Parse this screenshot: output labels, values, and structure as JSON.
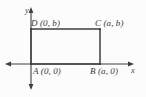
{
  "figure": {
    "kind": "coordinate-geometry-diagram",
    "background_color": "#fcfcfc",
    "stroke_color": "#3f3f3f",
    "text_color": "#3a3a3a"
  },
  "axes": {
    "x_label": "x",
    "y_label": "y",
    "origin_label": "A (0, 0)",
    "x_axis": {
      "arrow_right": true,
      "arrow_left": true,
      "y_px": 64
    },
    "y_axis": {
      "arrow_up": true,
      "arrow_down": true,
      "x_px": 31
    }
  },
  "vertices": [
    {
      "name": "A",
      "label": "A (0, 0)",
      "coords": "(0, 0)",
      "x": 0,
      "y": 0
    },
    {
      "name": "B",
      "label": "B (a, 0)",
      "coords": "(a, 0)",
      "x": "a",
      "y": 0
    },
    {
      "name": "C",
      "label": "C (a, b)",
      "coords": "(a, b)",
      "x": "a",
      "y": "b"
    },
    {
      "name": "D",
      "label": "D (0, b)",
      "coords": "(0, b)",
      "x": 0,
      "y": "b"
    }
  ],
  "shape": {
    "type": "rectangle",
    "width_expr": "a",
    "height_expr": "b",
    "px": {
      "left": 31,
      "top": 29,
      "right": 100,
      "bottom": 64
    }
  }
}
